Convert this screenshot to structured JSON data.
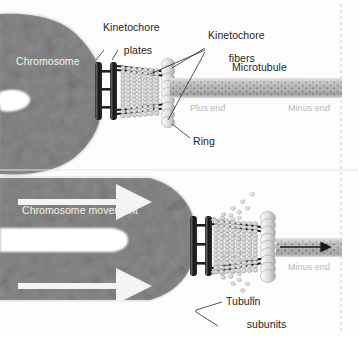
{
  "figure": {
    "panels": [
      {
        "id": "top",
        "caption": "Attached kinetochore with intact microtubule"
      },
      {
        "id": "bottom",
        "caption": "Depolymerizing microtubule pulling chromosome"
      }
    ]
  },
  "colors": {
    "chromosome": "#8a8a8a",
    "chromosome_dark": "#777777",
    "plate": "#1a1a1a",
    "ring": "#d8d8d8",
    "microtubule": "#b9b9b9",
    "microtubule_dark": "#9a9a9a",
    "label": "#1d1d1d",
    "label_white": "#f2f2f2",
    "label_gray": "#b8b8b8",
    "arrow_white": "#f4f4f4",
    "arrow_dark": "#1a1a1a",
    "divider": "#c9c9c9"
  },
  "top_panel": {
    "chromosome_label": "Chromosome",
    "kinetochore_plates_label": "Kinetochore\nplates",
    "kinetochore_plates_line1": "Kinetochore",
    "kinetochore_plates_line2": "plates",
    "kinetochore_fibers_line1": "Kinetochore",
    "kinetochore_fibers_line2": "fibers",
    "microtubule_label": "Microtubule",
    "plus_end_label": "Plus end",
    "minus_end_label": "Minus end",
    "ring_label": "Ring"
  },
  "bottom_panel": {
    "chromosome_movement_label": "Chromosome movement",
    "minus_end_label": "Minus end",
    "tubulin_line1": "Tubulin",
    "tubulin_line2": "subunits"
  },
  "structures": {
    "plate_count": 2,
    "plate_rungs": 3,
    "ring_subunit_count": 9,
    "protofilament_rows": 13,
    "movement_arrow_count": 2
  }
}
